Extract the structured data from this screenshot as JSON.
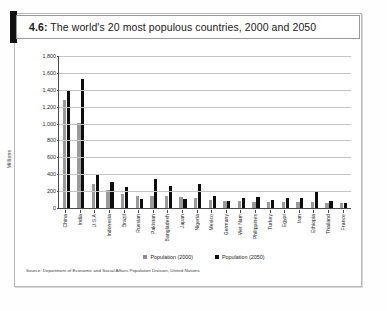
{
  "figure": {
    "number": "4.6:",
    "title": "The world's 20 most populous countries, 2000 and 2050",
    "source": "Source: Department of Economic and Social Affairs Population Division, United Nations"
  },
  "legend": {
    "items": [
      {
        "label": "Population (2000)",
        "color": "#8e8e8e"
      },
      {
        "label": "Population (2050)",
        "color": "#0d0d0d"
      }
    ]
  },
  "chart_data": {
    "type": "bar",
    "title": "The world's 20 most populous countries, 2000 and 2050",
    "xlabel": "",
    "ylabel": "Millions",
    "ylim": [
      0,
      1800
    ],
    "ytick_step": 200,
    "yticks": [
      "0",
      "200",
      "400",
      "600",
      "800",
      "1,000",
      "1,200",
      "1,400",
      "1,600",
      "1,800"
    ],
    "grid": true,
    "legend_position": "bottom-center",
    "categories": [
      "China",
      "India",
      "U.S.A",
      "Indonesia",
      "Brazil",
      "Russian",
      "Pakistan",
      "Bangladesh",
      "Japan",
      "Nigeria",
      "Mexico",
      "Germany",
      "Viet Nam",
      "Philippines",
      "Turkey",
      "Egypt",
      "Iran",
      "Ethiopia",
      "Thailand",
      "France"
    ],
    "series": [
      {
        "name": "Population (2000)",
        "color": "#9a9a9a",
        "values": [
          1275,
          1009,
          283,
          212,
          170,
          146,
          142,
          137,
          127,
          114,
          98,
          82,
          78,
          76,
          66,
          68,
          70,
          66,
          61,
          59
        ]
      },
      {
        "name": "Population (2050)",
        "color": "#0d0d0d",
        "values": [
          1395,
          1525,
          397,
          311,
          247,
          104,
          344,
          265,
          110,
          279,
          147,
          79,
          124,
          129,
          98,
          114,
          121,
          186,
          82,
          62
        ]
      }
    ]
  }
}
